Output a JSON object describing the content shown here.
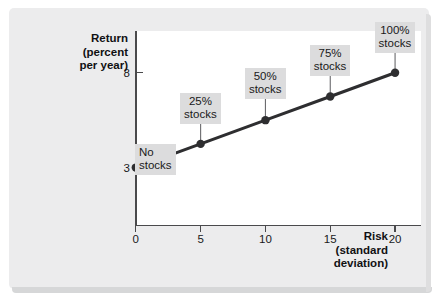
{
  "figure": {
    "background_color": "#ececed",
    "plot_background_color": "#ffffff",
    "line_color": "#2e2e30",
    "callout_background_color": "#dcdcdd"
  },
  "chart_data": {
    "type": "line",
    "title": "",
    "xlabel": "Risk (standard deviation)",
    "ylabel": "Return (percent per year)",
    "xlabel_lines": [
      "Risk",
      "(standard",
      "deviation)"
    ],
    "ylabel_lines": [
      "Return",
      "(percent",
      "per year)"
    ],
    "xlim": [
      0,
      22
    ],
    "ylim": [
      0,
      10.2
    ],
    "grid": false,
    "legend": "none",
    "x_ticks": [
      0,
      5,
      10,
      15,
      20
    ],
    "x_tick_labels": [
      "0",
      "5",
      "10",
      "15",
      "20"
    ],
    "y_ticks": [
      3,
      8
    ],
    "y_tick_labels": [
      "3",
      "8"
    ],
    "x": [
      0,
      5,
      10,
      15,
      20
    ],
    "values": [
      3,
      4.25,
      5.5,
      6.75,
      8
    ],
    "point_labels": [
      "No stocks",
      "25% stocks",
      "50% stocks",
      "75% stocks",
      "100% stocks"
    ],
    "annotations": [
      {
        "label_lines": [
          "No",
          "stocks"
        ],
        "x": 0,
        "y": 3,
        "leader": "diagonal"
      },
      {
        "label_lines": [
          "25%",
          "stocks"
        ],
        "x": 5,
        "y": 4.25,
        "leader": "vertical"
      },
      {
        "label_lines": [
          "50%",
          "stocks"
        ],
        "x": 10,
        "y": 5.5,
        "leader": "vertical"
      },
      {
        "label_lines": [
          "75%",
          "stocks"
        ],
        "x": 15,
        "y": 6.75,
        "leader": "vertical"
      },
      {
        "label_lines": [
          "100%",
          "stocks"
        ],
        "x": 20,
        "y": 8,
        "leader": "vertical"
      }
    ]
  }
}
